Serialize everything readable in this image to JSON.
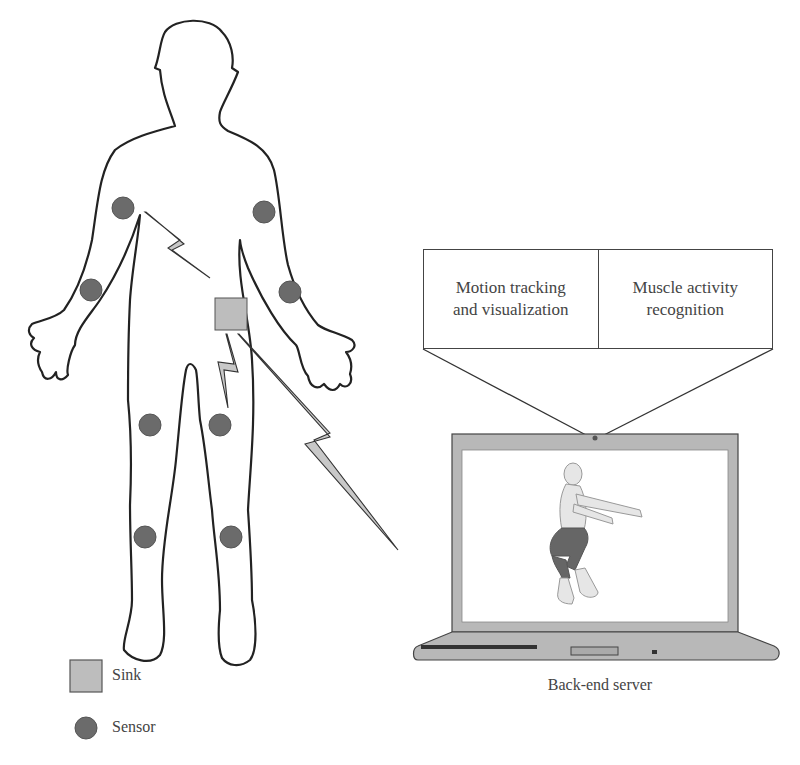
{
  "diagram": {
    "backend_functions": [
      {
        "label": "Motion tracking\nand visualization",
        "line1": "Motion tracking",
        "line2": "and visualization"
      },
      {
        "label": "Muscle activity\nrecognition",
        "line1": "Muscle activity",
        "line2": "recognition"
      }
    ],
    "server_caption": "Back-end server",
    "legend": [
      {
        "symbol": "square",
        "label": "Sink",
        "color": "#bdbdbd"
      },
      {
        "symbol": "circle",
        "label": "Sensor",
        "color": "#6b6b6b"
      }
    ],
    "sensors": [
      {
        "location": "right upper arm",
        "x": 123,
        "y": 208
      },
      {
        "location": "left upper arm",
        "x": 264,
        "y": 212
      },
      {
        "location": "right forearm",
        "x": 91,
        "y": 290
      },
      {
        "location": "left forearm",
        "x": 290,
        "y": 292
      },
      {
        "location": "right thigh",
        "x": 150,
        "y": 425
      },
      {
        "location": "left thigh",
        "x": 220,
        "y": 425
      },
      {
        "location": "right shin",
        "x": 145,
        "y": 537
      },
      {
        "location": "left shin",
        "x": 231,
        "y": 537
      }
    ],
    "sink": {
      "x": 215,
      "y": 298,
      "size": 32
    },
    "links": [
      {
        "from": "sensor",
        "to": "sink",
        "type": "lightning"
      },
      {
        "from": "sensor",
        "to": "sink",
        "type": "lightning"
      },
      {
        "from": "sink",
        "to": "back-end server",
        "type": "lightning"
      }
    ],
    "colors": {
      "outline": "#222222",
      "sensor": "#6b6b6b",
      "sink": "#bdbdbd",
      "laptop_body": "#b8b8b8",
      "bolt_fill": "#c8c8c8"
    }
  }
}
